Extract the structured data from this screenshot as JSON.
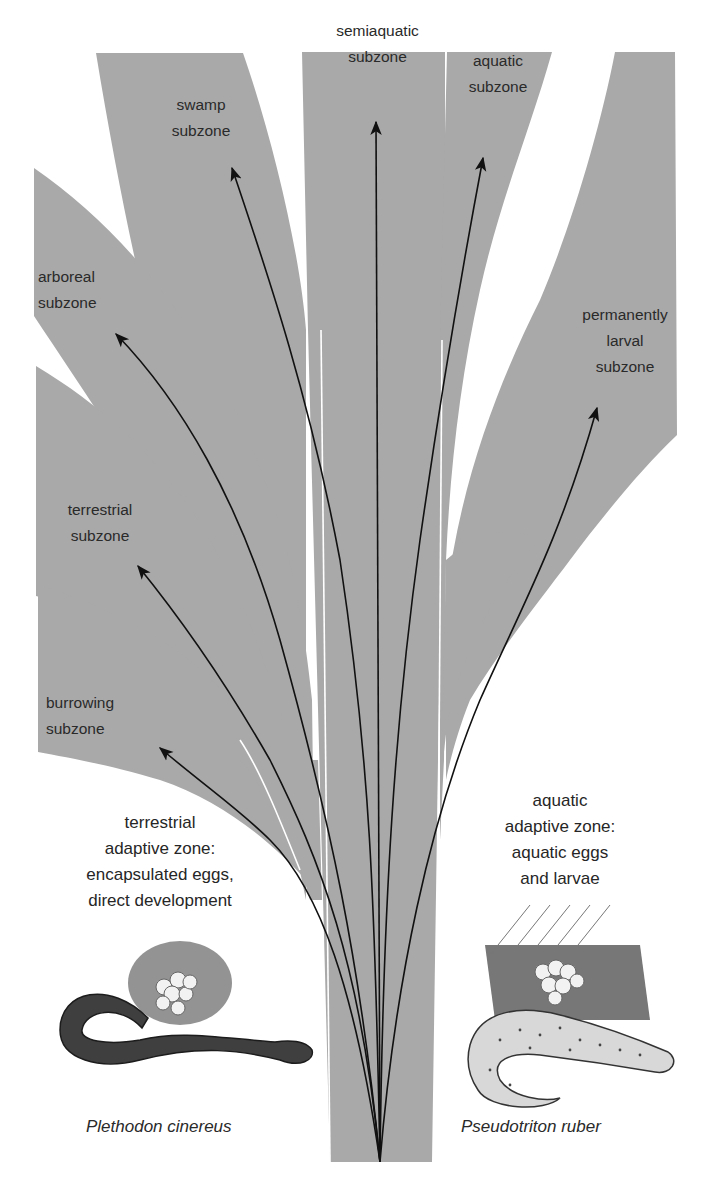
{
  "colors": {
    "band_fill": "#a9a9a9",
    "arrow": "#111111",
    "background": "#ffffff",
    "text": "#2a2a2a"
  },
  "subzones": [
    {
      "id": "swamp",
      "label": "swamp\nsubzone"
    },
    {
      "id": "semiaquatic",
      "label": "semiaquatic\nsubzone"
    },
    {
      "id": "aquatic",
      "label": "aquatic\nsubzone"
    },
    {
      "id": "arboreal",
      "label": "arboreal\nsubzone"
    },
    {
      "id": "permanently-larval",
      "label": "permanently\nlarval\nsubzone"
    },
    {
      "id": "terrestrial",
      "label": "terrestrial\nsubzone"
    },
    {
      "id": "burrowing",
      "label": "burrowing\nsubzone"
    }
  ],
  "adaptive_zones": {
    "terrestrial": "terrestrial\nadaptive zone:\nencapsulated eggs,\ndirect development",
    "aquatic": "aquatic\nadaptive zone:\naquatic eggs\nand larvae"
  },
  "species": {
    "left": "Plethodon cinereus",
    "right": "Pseudotriton ruber"
  },
  "icons": {
    "arrow": "arrowhead",
    "left_illustration": "salamander-with-eggs",
    "right_illustration": "spotted-salamander-with-eggs"
  }
}
